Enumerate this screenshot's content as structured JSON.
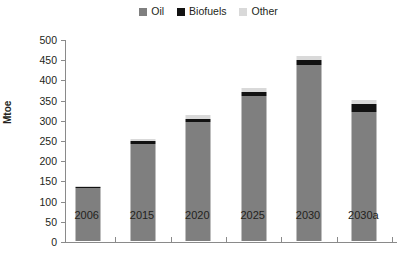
{
  "chart_data": {
    "type": "bar",
    "stacked": true,
    "title": "",
    "xlabel": "",
    "ylabel": "Mtoe",
    "ylim": [
      0,
      500
    ],
    "ytick_step": 50,
    "yticks": [
      0,
      50,
      100,
      150,
      200,
      250,
      300,
      350,
      400,
      450,
      500
    ],
    "categories": [
      "2006",
      "2015",
      "2020",
      "2025",
      "2030",
      "2030a"
    ],
    "series": [
      {
        "name": "Oil",
        "color": "#7f7f7f",
        "values": [
          130,
          240,
          295,
          360,
          435,
          320
        ]
      },
      {
        "name": "Biofuels",
        "color": "#121212",
        "values": [
          2,
          7,
          8,
          10,
          12,
          20
        ]
      },
      {
        "name": "Other",
        "color": "#d9d9d9",
        "values": [
          3,
          5,
          8,
          10,
          12,
          8
        ]
      }
    ],
    "totals": [
      135,
      252,
      311,
      380,
      459,
      348
    ],
    "grid": false,
    "legend_position": "top"
  },
  "legend": {
    "items": [
      {
        "label": "Oil",
        "color": "#7f7f7f"
      },
      {
        "label": "Biofuels",
        "color": "#121212"
      },
      {
        "label": "Other",
        "color": "#d9d9d9"
      }
    ]
  },
  "axes": {
    "y_title": "Mtoe",
    "y_labels": [
      "500",
      "450",
      "400",
      "350",
      "300",
      "250",
      "200",
      "150",
      "100",
      "50",
      "0"
    ],
    "x_labels": [
      "2006",
      "2015",
      "2020",
      "2025",
      "2030",
      "2030a"
    ]
  },
  "colors": {
    "oil": "#7f7f7f",
    "biofuels": "#121212",
    "other": "#d9d9d9",
    "axis": "#8a8a8a",
    "text": "#231f20",
    "background": "#ffffff"
  }
}
